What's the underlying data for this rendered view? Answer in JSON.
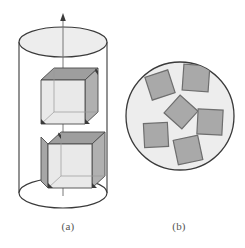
{
  "figure": {
    "background_color": "#ffffff",
    "panels": [
      {
        "id": "a",
        "caption": "(a)",
        "view": "side view",
        "description": "Vertical cylinder containing two cube-shaped particles aligned on the central rotation axis"
      },
      {
        "id": "b",
        "caption": "(b)",
        "view": "top view",
        "description": "Circular cross-section of the cylinder with six randomly oriented square particles"
      }
    ]
  },
  "colors": {
    "outline": "#3a3a3a",
    "outline_light": "#5a5a5a",
    "disc_fill": "#ededed",
    "square_fill": "#a9a9a9",
    "square_stroke": "#6e6e6e",
    "cube_top": "#9e9e9e",
    "cube_side": "#b4b4b4",
    "cube_front": "#e8e8e8",
    "cube_edge": "#4a4a4a",
    "axis_line": "#555555",
    "caption_text": "#555555"
  },
  "panel_a": {
    "name": "cylinder-side-view",
    "cylinder": {
      "center_x": 63,
      "top_ellipse_cy": 42,
      "bottom_ellipse_cy": 193,
      "rx": 44,
      "ry": 15,
      "top_fill": "#ededed",
      "bottom_fill": "#ffffff"
    },
    "axis": {
      "label": "rotation axis",
      "x": 63,
      "y_top": 14,
      "y_bottom": 196,
      "arrow_tip_y": 14
    },
    "cubes": [
      {
        "name": "upper-cube",
        "center_x": 63,
        "center_y": 102,
        "size": 44,
        "depth": 13,
        "position": "suspended"
      },
      {
        "name": "lower-cube",
        "center_x": 70,
        "center_y": 166,
        "size": 44,
        "depth": 13,
        "position": "resting on base"
      }
    ]
  },
  "panel_b": {
    "name": "disc-top-view",
    "disc": {
      "center_x": 180,
      "center_y": 116,
      "radius": 54,
      "fill": "#ededed",
      "stroke": "#3a3a3a"
    },
    "squares": [
      {
        "id": 1,
        "cx": 160,
        "cy": 85,
        "size": 24,
        "rotation": -18
      },
      {
        "id": 2,
        "cx": 196,
        "cy": 78,
        "size": 26,
        "rotation": 4
      },
      {
        "id": 3,
        "cx": 181,
        "cy": 112,
        "size": 24,
        "rotation": 42
      },
      {
        "id": 4,
        "cx": 210,
        "cy": 122,
        "size": 25,
        "rotation": 3
      },
      {
        "id": 5,
        "cx": 156,
        "cy": 135,
        "size": 24,
        "rotation": -3
      },
      {
        "id": 6,
        "cx": 188,
        "cy": 150,
        "size": 25,
        "rotation": -12
      }
    ]
  },
  "captions": {
    "a": "(a)",
    "b": "(b)"
  }
}
